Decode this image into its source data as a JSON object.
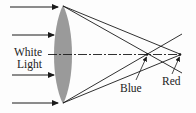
{
  "diagram": {
    "labels": {
      "white": "White",
      "light": "Light",
      "blue": "Blue",
      "red": "Red"
    },
    "colors": {
      "lens": "#9a9a9a",
      "lines": "#1a1a1a",
      "text": "#222222",
      "background": "#fdfdfd"
    },
    "incoming_rays": 4,
    "focal_points": [
      "Blue",
      "Red"
    ]
  }
}
